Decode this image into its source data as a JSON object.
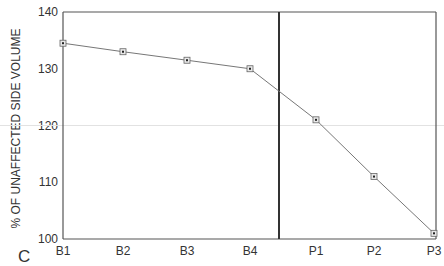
{
  "panel_label": "C",
  "chart_data": {
    "type": "line",
    "title": "",
    "xlabel": "",
    "ylabel": "% OF UNAFFECTED SIDE VOLUME",
    "categories": [
      "B1",
      "B2",
      "B3",
      "B4",
      "P1",
      "P2",
      "P3"
    ],
    "series": [
      {
        "name": "volume",
        "values": [
          134.5,
          133,
          131.5,
          130,
          121,
          111,
          101
        ]
      }
    ],
    "ylim": [
      100,
      140
    ],
    "yticks": [
      100,
      110,
      120,
      130,
      140
    ],
    "reference_line": 120,
    "divider_between": [
      "B4",
      "P1"
    ],
    "grid": false,
    "legend": "none"
  }
}
